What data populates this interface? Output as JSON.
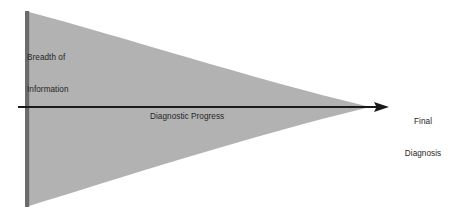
{
  "diagram": {
    "type": "funnel-concept-diagram",
    "background_color": "#ffffff",
    "labels": {
      "breadth_line1": "Breadth of",
      "breadth_line2": "Information",
      "progress": "Diagnostic Progress",
      "final_line1": "Final",
      "final_line2": "Diagnosis"
    },
    "shapes": {
      "funnel": {
        "name": "breadth-of-information-funnel",
        "fill_color": "#b2b2b2",
        "description": "Wide at left, converging to a point at right; both upper and lower edges curve concavely inward.",
        "left_top_y": 12,
        "left_bottom_y": 206,
        "tip_x": 366,
        "tip_y": 107
      },
      "left_bar": {
        "name": "breadth-axis-bar",
        "fill_color": "#6b6b6b",
        "x": 25,
        "top_y": 11,
        "bottom_y": 207,
        "width": 4
      },
      "arrow": {
        "name": "diagnostic-progress-arrow",
        "stroke_color": "#1a1a1a",
        "start_x": 18,
        "end_x": 389,
        "y": 107,
        "thickness": 2.2,
        "head_length": 14,
        "head_half_height": 5
      }
    },
    "text_color": "#262626"
  }
}
